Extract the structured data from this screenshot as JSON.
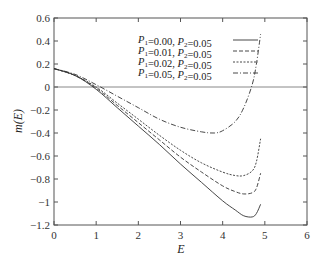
{
  "chart_data": {
    "type": "line",
    "title": "",
    "xlabel": "E",
    "ylabel": "m(E)",
    "xlim": [
      0,
      6
    ],
    "ylim": [
      -1.2,
      0.6
    ],
    "xticks": [
      0,
      1,
      2,
      3,
      4,
      5,
      6
    ],
    "yticks": [
      0.6,
      0.4,
      0.2,
      0,
      -0.2,
      -0.4,
      -0.6,
      -0.8,
      -1,
      -1.2
    ],
    "ytick_labels": [
      "0.6",
      "0.4",
      "0.2",
      "0",
      "−0.2",
      "−0.4",
      "−0.6",
      "−0.8",
      "−1",
      "−1.2"
    ],
    "grid": false,
    "reference_line_y": 0,
    "legend_position": "upper-center",
    "series": [
      {
        "name": "P1=0.00, P2=0.05",
        "label_p1": "0.00",
        "label_p2": "0.05",
        "style": "solid",
        "x": [
          0,
          0.5,
          1,
          1.5,
          2,
          2.5,
          3,
          3.5,
          4,
          4.3,
          4.5,
          4.7,
          4.8,
          4.9
        ],
        "y": [
          0.16,
          0.1,
          -0.02,
          -0.18,
          -0.34,
          -0.5,
          -0.67,
          -0.83,
          -0.99,
          -1.07,
          -1.12,
          -1.13,
          -1.1,
          -1.02
        ]
      },
      {
        "name": "P1=0.01, P2=0.05",
        "label_p1": "0.01",
        "label_p2": "0.05",
        "style": "dashed",
        "x": [
          0,
          0.5,
          1,
          1.5,
          2,
          2.5,
          3,
          3.5,
          4,
          4.3,
          4.5,
          4.7,
          4.8,
          4.9
        ],
        "y": [
          0.16,
          0.1,
          -0.01,
          -0.16,
          -0.31,
          -0.46,
          -0.61,
          -0.74,
          -0.86,
          -0.91,
          -0.93,
          -0.92,
          -0.88,
          -0.75
        ]
      },
      {
        "name": "P1=0.02, P2=0.05",
        "label_p1": "0.02",
        "label_p2": "0.05",
        "style": "dotted",
        "x": [
          0,
          0.5,
          1,
          1.5,
          2,
          2.5,
          3,
          3.5,
          4,
          4.3,
          4.5,
          4.7,
          4.8,
          4.9
        ],
        "y": [
          0.16,
          0.1,
          0,
          -0.14,
          -0.28,
          -0.42,
          -0.55,
          -0.66,
          -0.74,
          -0.77,
          -0.77,
          -0.73,
          -0.65,
          -0.45
        ]
      },
      {
        "name": "P1=0.05, P2=0.05",
        "label_p1": "0.05",
        "label_p2": "0.05",
        "style": "dashdot",
        "x": [
          0,
          0.5,
          1,
          1.5,
          2,
          2.5,
          3,
          3.5,
          3.8,
          4,
          4.3,
          4.5,
          4.7,
          4.8,
          4.9
        ],
        "y": [
          0.16,
          0.11,
          0.02,
          -0.08,
          -0.18,
          -0.28,
          -0.35,
          -0.39,
          -0.4,
          -0.38,
          -0.3,
          -0.18,
          0.02,
          0.2,
          0.46
        ]
      }
    ]
  },
  "legend": {
    "entries": [
      {
        "p1": "0.00",
        "p2": "0.05"
      },
      {
        "p1": "0.01",
        "p2": "0.05"
      },
      {
        "p1": "0.02",
        "p2": "0.05"
      },
      {
        "p1": "0.05",
        "p2": "0.05"
      }
    ]
  }
}
